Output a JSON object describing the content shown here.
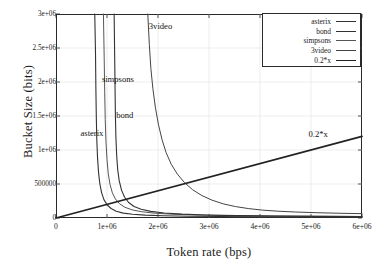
{
  "chart_data": {
    "type": "line",
    "title": "",
    "xlabel": "Token rate (bps)",
    "ylabel": "Bucket Size (bits)",
    "xlim": [
      0,
      6000000
    ],
    "ylim": [
      0,
      3000000
    ],
    "grid": true,
    "legend_position": "top-right",
    "xticks": [
      {
        "value": 0,
        "label": "0"
      },
      {
        "value": 1000000,
        "label": "1e+06"
      },
      {
        "value": 2000000,
        "label": "2e+06"
      },
      {
        "value": 3000000,
        "label": "3e+06"
      },
      {
        "value": 4000000,
        "label": "4e+06"
      },
      {
        "value": 5000000,
        "label": "5e+06"
      },
      {
        "value": 6000000,
        "label": "6e+06"
      }
    ],
    "yticks": [
      {
        "value": 0,
        "label": "0"
      },
      {
        "value": 500000,
        "label": "500000"
      },
      {
        "value": 1000000,
        "label": "1e+06"
      },
      {
        "value": 1500000,
        "label": "1.5e+06"
      },
      {
        "value": 2000000,
        "label": "2e+06"
      },
      {
        "value": 2500000,
        "label": "2.5e+06"
      },
      {
        "value": 3000000,
        "label": "3e+06"
      }
    ],
    "legend": [
      {
        "name": "asterix",
        "color": "#333333",
        "width": 1.1
      },
      {
        "name": "bond",
        "color": "#333333",
        "width": 1.1
      },
      {
        "name": "simpsons",
        "color": "#555555",
        "width": 1.0
      },
      {
        "name": "3video",
        "color": "#444444",
        "width": 1.0
      },
      {
        "name": "0.2*x",
        "color": "#222222",
        "width": 1.7
      }
    ],
    "annotations": [
      {
        "text": "asterix",
        "x": 480000,
        "y": 1250000
      },
      {
        "text": "bond",
        "x": 1180000,
        "y": 1520000
      },
      {
        "text": "simpsons",
        "x": 900000,
        "y": 2050000
      },
      {
        "text": "3video",
        "x": 1820000,
        "y": 2830000
      },
      {
        "text": "0.2*x",
        "x": 4950000,
        "y": 1230000
      }
    ],
    "series": [
      {
        "name": "asterix",
        "color": "#333333",
        "width": 1.1,
        "asymptote_x": 780000,
        "points": [
          [
            760000,
            3000000
          ],
          [
            775000,
            2400000
          ],
          [
            782000,
            1900000
          ],
          [
            790000,
            1500000
          ],
          [
            800000,
            1150000
          ],
          [
            815000,
            880000
          ],
          [
            835000,
            660000
          ],
          [
            860000,
            500000
          ],
          [
            895000,
            370000
          ],
          [
            940000,
            270000
          ],
          [
            1000000,
            195000
          ],
          [
            1080000,
            140000
          ],
          [
            1180000,
            100000
          ],
          [
            1320000,
            72000
          ],
          [
            1500000,
            55000
          ],
          [
            1750000,
            42000
          ],
          [
            2100000,
            33000
          ],
          [
            2600000,
            26000
          ],
          [
            3200000,
            21000
          ],
          [
            4000000,
            17000
          ],
          [
            5000000,
            14000
          ],
          [
            6000000,
            12000
          ]
        ]
      },
      {
        "name": "simpsons",
        "color": "#555555",
        "width": 1.0,
        "asymptote_x": 950000,
        "points": [
          [
            930000,
            3000000
          ],
          [
            945000,
            2350000
          ],
          [
            955000,
            1850000
          ],
          [
            965000,
            1450000
          ],
          [
            980000,
            1120000
          ],
          [
            1000000,
            860000
          ],
          [
            1025000,
            650000
          ],
          [
            1060000,
            490000
          ],
          [
            1105000,
            370000
          ],
          [
            1165000,
            280000
          ],
          [
            1245000,
            210000
          ],
          [
            1350000,
            158000
          ],
          [
            1490000,
            120000
          ],
          [
            1680000,
            92000
          ],
          [
            1950000,
            70000
          ],
          [
            2300000,
            55000
          ],
          [
            2800000,
            43000
          ],
          [
            3400000,
            35000
          ],
          [
            4200000,
            29000
          ],
          [
            5100000,
            25000
          ],
          [
            6000000,
            22000
          ]
        ]
      },
      {
        "name": "bond",
        "color": "#333333",
        "width": 1.1,
        "asymptote_x": 1100000,
        "points": [
          [
            1140000,
            3000000
          ],
          [
            1150000,
            2400000
          ],
          [
            1158000,
            1900000
          ],
          [
            1165000,
            1500000
          ],
          [
            1175000,
            1180000
          ],
          [
            1190000,
            920000
          ],
          [
            1210000,
            710000
          ],
          [
            1240000,
            545000
          ],
          [
            1285000,
            410000
          ],
          [
            1345000,
            305000
          ],
          [
            1425000,
            228000
          ],
          [
            1530000,
            170000
          ],
          [
            1670000,
            128000
          ],
          [
            1860000,
            97000
          ],
          [
            2120000,
            74000
          ],
          [
            2470000,
            57000
          ],
          [
            2950000,
            44000
          ],
          [
            3550000,
            35000
          ],
          [
            4350000,
            28000
          ],
          [
            5200000,
            24000
          ],
          [
            6000000,
            21000
          ]
        ]
      },
      {
        "name": "3video",
        "color": "#444444",
        "width": 1.0,
        "asymptote_x": 1750000,
        "points": [
          [
            1800000,
            3000000
          ],
          [
            1830000,
            2550000
          ],
          [
            1860000,
            2200000
          ],
          [
            1900000,
            1900000
          ],
          [
            1950000,
            1620000
          ],
          [
            2010000,
            1370000
          ],
          [
            2080000,
            1150000
          ],
          [
            2160000,
            960000
          ],
          [
            2260000,
            790000
          ],
          [
            2380000,
            645000
          ],
          [
            2520000,
            520000
          ],
          [
            2680000,
            415000
          ],
          [
            2860000,
            330000
          ],
          [
            3060000,
            262000
          ],
          [
            3280000,
            208000
          ],
          [
            3520000,
            168000
          ],
          [
            3780000,
            138000
          ],
          [
            4050000,
            116000
          ],
          [
            4350000,
            100000
          ],
          [
            4700000,
            88000
          ],
          [
            5100000,
            78000
          ],
          [
            5550000,
            70000
          ],
          [
            6000000,
            64000
          ]
        ]
      },
      {
        "name": "0.2*x",
        "color": "#222222",
        "width": 1.7,
        "points": [
          [
            0,
            0
          ],
          [
            6000000,
            1200000
          ]
        ]
      }
    ]
  }
}
